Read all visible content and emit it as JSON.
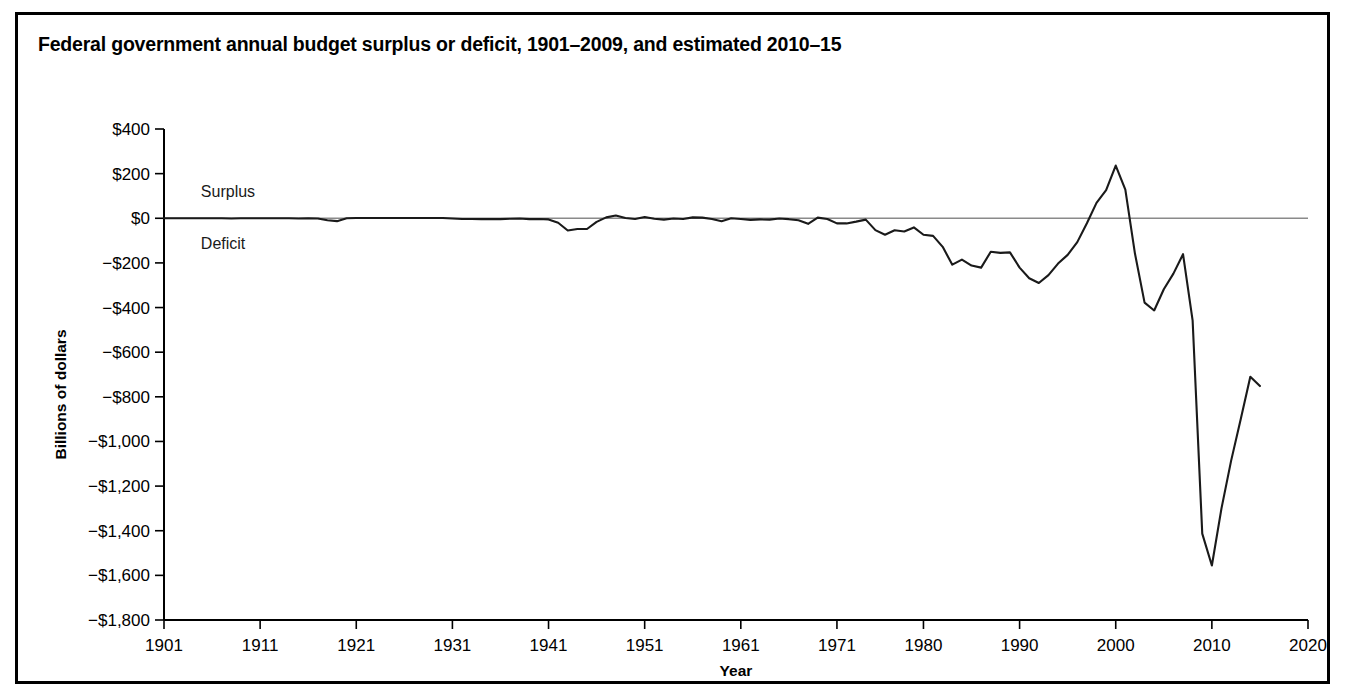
{
  "figure": {
    "title": "Federal government annual budget surplus or deficit, 1901–2009, and estimated 2010–15",
    "border_color": "#000000",
    "background": "#ffffff"
  },
  "chart_data": {
    "type": "line",
    "title": "Federal government annual budget surplus or deficit, 1901–2009, and estimated 2010–15",
    "xlabel": "Year",
    "ylabel": "Billions of dollars",
    "xlim": [
      1901,
      2020
    ],
    "ylim": [
      -1800,
      400
    ],
    "grid": false,
    "legend": "none",
    "zero_line": true,
    "line_color": "#1a1a1a",
    "x_tick_labels": [
      "1901",
      "1911",
      "1921",
      "1931",
      "1941",
      "1951",
      "1961",
      "1971",
      "1980",
      "1990",
      "2000",
      "2010",
      "2020"
    ],
    "x_tick_values": [
      1901,
      1911,
      1921,
      1931,
      1941,
      1951,
      1961,
      1971,
      1980,
      1990,
      2000,
      2010,
      2020
    ],
    "y_tick_labels": [
      "$400",
      "$200",
      "$0",
      "−$200",
      "−$400",
      "−$600",
      "−$800",
      "−$1,000",
      "−$1,200",
      "−$1,400",
      "−$1,600",
      "−$1,800"
    ],
    "y_tick_values": [
      400,
      200,
      0,
      -200,
      -400,
      -600,
      -800,
      -1000,
      -1200,
      -1400,
      -1600,
      -1800
    ],
    "annotations": [
      {
        "text": "Surplus",
        "x": 1904,
        "y": 120
      },
      {
        "text": "Deficit",
        "x": 1904,
        "y": -110
      }
    ],
    "series": [
      {
        "name": "Annual budget surplus or deficit",
        "units": "billions of dollars",
        "x": [
          1901,
          1902,
          1903,
          1904,
          1905,
          1906,
          1907,
          1908,
          1909,
          1910,
          1911,
          1912,
          1913,
          1914,
          1915,
          1916,
          1917,
          1918,
          1919,
          1920,
          1921,
          1922,
          1923,
          1924,
          1925,
          1926,
          1927,
          1928,
          1929,
          1930,
          1931,
          1932,
          1933,
          1934,
          1935,
          1936,
          1937,
          1938,
          1939,
          1940,
          1941,
          1942,
          1943,
          1944,
          1945,
          1946,
          1947,
          1948,
          1949,
          1950,
          1951,
          1952,
          1953,
          1954,
          1955,
          1956,
          1957,
          1958,
          1959,
          1960,
          1961,
          1962,
          1963,
          1964,
          1965,
          1966,
          1967,
          1968,
          1969,
          1970,
          1971,
          1972,
          1973,
          1974,
          1975,
          1976,
          1977,
          1978,
          1979,
          1980,
          1981,
          1982,
          1983,
          1984,
          1985,
          1986,
          1987,
          1988,
          1989,
          1990,
          1991,
          1992,
          1993,
          1994,
          1995,
          1996,
          1997,
          1998,
          1999,
          2000,
          2001,
          2002,
          2003,
          2004,
          2005,
          2006,
          2007,
          2008,
          2009,
          2010,
          2011,
          2012,
          2013,
          2014,
          2015
        ],
        "values": [
          0,
          0,
          0,
          0,
          0,
          0,
          0,
          -1,
          0,
          0,
          0,
          0,
          0,
          0,
          -1,
          0,
          -1,
          -9,
          -13,
          0,
          1,
          1,
          1,
          1,
          1,
          1,
          1,
          1,
          1,
          1,
          -1,
          -3,
          -3,
          -4,
          -3,
          -4,
          -2,
          -1,
          -4,
          -3,
          -5,
          -20,
          -55,
          -48,
          -48,
          -16,
          4,
          12,
          1,
          -3,
          6,
          -2,
          -6,
          -1,
          -3,
          4,
          3,
          -3,
          -13,
          0,
          -3,
          -7,
          -5,
          -6,
          -1,
          -4,
          -9,
          -25,
          3,
          -3,
          -23,
          -23,
          -15,
          -6,
          -53,
          -74,
          -54,
          -59,
          -41,
          -74,
          -79,
          -128,
          -208,
          -185,
          -212,
          -221,
          -150,
          -155,
          -153,
          -221,
          -269,
          -290,
          -255,
          -203,
          -164,
          -107,
          -22,
          69,
          126,
          236,
          128,
          -158,
          -378,
          -413,
          -318,
          -248,
          -161,
          -459,
          -1413,
          -1556,
          -1300,
          -1087,
          -900,
          -710,
          -752
        ]
      }
    ]
  },
  "axis_geometry": {
    "plot_left": 161,
    "plot_right": 1305,
    "plot_top": 126,
    "plot_bottom": 617
  }
}
